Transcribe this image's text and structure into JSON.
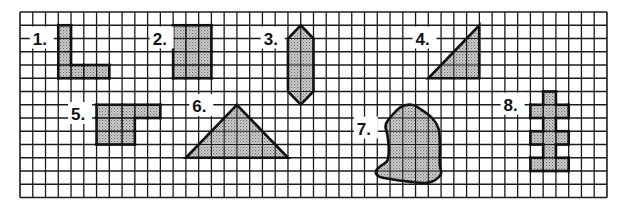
{
  "figure": {
    "type": "grid-shapes-worksheet",
    "grid": {
      "columns": 46,
      "rows": 14
    },
    "colors": {
      "grid_line": "#1a1a1a",
      "shape_stroke": "#111111",
      "shape_fill": "#bdbdbd",
      "background": "#ffffff"
    },
    "shapes": [
      {
        "id": 1,
        "label": "1.",
        "kind": "cells",
        "description": "L-shape",
        "cells": [
          [
            3,
            1
          ],
          [
            3,
            2
          ],
          [
            3,
            3
          ],
          [
            3,
            4
          ],
          [
            4,
            4
          ],
          [
            5,
            4
          ],
          [
            6,
            4
          ]
        ]
      },
      {
        "id": 2,
        "label": "2.",
        "kind": "cells",
        "description": "rectangle 3x4",
        "cells": [
          [
            12,
            1
          ],
          [
            13,
            1
          ],
          [
            14,
            1
          ],
          [
            12,
            2
          ],
          [
            13,
            2
          ],
          [
            14,
            2
          ],
          [
            12,
            3
          ],
          [
            13,
            3
          ],
          [
            14,
            3
          ],
          [
            12,
            4
          ],
          [
            13,
            4
          ],
          [
            14,
            4
          ]
        ]
      },
      {
        "id": 3,
        "label": "3.",
        "kind": "polygon",
        "description": "elongated hexagon",
        "points": [
          [
            22,
            1
          ],
          [
            23,
            2
          ],
          [
            23,
            6
          ],
          [
            22,
            7
          ],
          [
            21,
            6
          ],
          [
            21,
            2
          ]
        ]
      },
      {
        "id": 4,
        "label": "4.",
        "kind": "polygon",
        "description": "right triangle",
        "points": [
          [
            32,
            5
          ],
          [
            36,
            5
          ],
          [
            36,
            1
          ]
        ]
      },
      {
        "id": 5,
        "label": "5.",
        "kind": "cells",
        "description": "step shape",
        "cells": [
          [
            6,
            7
          ],
          [
            7,
            7
          ],
          [
            8,
            7
          ],
          [
            9,
            7
          ],
          [
            10,
            7
          ],
          [
            6,
            8
          ],
          [
            7,
            8
          ],
          [
            8,
            8
          ],
          [
            6,
            9
          ],
          [
            7,
            9
          ],
          [
            8,
            9
          ]
        ]
      },
      {
        "id": 6,
        "label": "6.",
        "kind": "polygon",
        "description": "isosceles triangle",
        "points": [
          [
            13,
            11
          ],
          [
            17,
            7
          ],
          [
            21,
            11
          ]
        ]
      },
      {
        "id": 7,
        "label": "7.",
        "kind": "blob",
        "description": "irregular curved shape",
        "points": [
          [
            28.7,
            8.4
          ],
          [
            29.8,
            7.2
          ],
          [
            30.7,
            7.0
          ],
          [
            31.5,
            7.4
          ],
          [
            32.3,
            8.0
          ],
          [
            32.8,
            8.8
          ],
          [
            32.9,
            10.0
          ],
          [
            32.9,
            11.5
          ],
          [
            33.0,
            12.2
          ],
          [
            32.5,
            12.7
          ],
          [
            31.8,
            12.9
          ],
          [
            30.5,
            12.8
          ],
          [
            29.0,
            12.6
          ],
          [
            28.1,
            12.4
          ],
          [
            27.9,
            12.0
          ],
          [
            28.3,
            11.6
          ],
          [
            28.8,
            11.2
          ],
          [
            28.9,
            10.3
          ],
          [
            28.8,
            9.3
          ]
        ]
      },
      {
        "id": 8,
        "label": "8.",
        "kind": "cells",
        "description": "cross-like column",
        "cells": [
          [
            41,
            6
          ],
          [
            40,
            7
          ],
          [
            41,
            7
          ],
          [
            42,
            7
          ],
          [
            41,
            8
          ],
          [
            40,
            9
          ],
          [
            41,
            9
          ],
          [
            42,
            9
          ],
          [
            41,
            10
          ],
          [
            40,
            11
          ],
          [
            41,
            11
          ],
          [
            42,
            11
          ]
        ]
      }
    ],
    "labels": [
      {
        "text": "1.",
        "at": [
          1.0,
          2.0
        ]
      },
      {
        "text": "2.",
        "at": [
          10.4,
          2.0
        ]
      },
      {
        "text": "3.",
        "at": [
          19.1,
          2.0
        ]
      },
      {
        "text": "4.",
        "at": [
          31.0,
          2.0
        ]
      },
      {
        "text": "5.",
        "at": [
          4.0,
          7.7
        ]
      },
      {
        "text": "6.",
        "at": [
          13.5,
          7.1
        ]
      },
      {
        "text": "7.",
        "at": [
          26.4,
          8.8
        ]
      },
      {
        "text": "8.",
        "at": [
          37.9,
          7.0
        ]
      }
    ]
  }
}
